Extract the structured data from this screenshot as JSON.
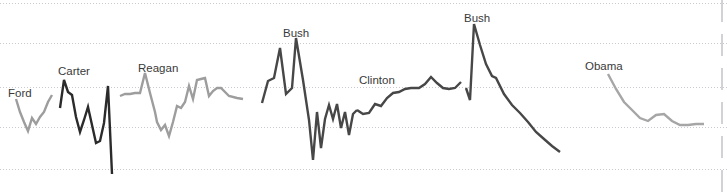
{
  "chart_data": {
    "type": "line",
    "title": "",
    "subtitle": "",
    "xlabel": "",
    "ylabel": "",
    "grid": true,
    "grid_style": "dotted-horizontal",
    "legend": "inline-annotations",
    "xlim": [
      0,
      727
    ],
    "ylim": [
      195,
      0
    ],
    "gridlines_y": [
      3,
      43,
      87,
      127,
      169
    ],
    "annotations": [
      {
        "text": "Ford",
        "x": 8,
        "y": 97
      },
      {
        "text": "Carter",
        "x": 58,
        "y": 75
      },
      {
        "text": "Reagan",
        "x": 138,
        "y": 72
      },
      {
        "text": "Bush",
        "x": 283,
        "y": 37
      },
      {
        "text": "Clinton",
        "x": 359,
        "y": 84
      },
      {
        "text": "Bush",
        "x": 464,
        "y": 22
      },
      {
        "text": "Obama",
        "x": 585,
        "y": 70
      }
    ],
    "series": [
      {
        "name": "Ford",
        "color": "#9d9d9d",
        "width": 2.4,
        "points": [
          [
            16,
            99
          ],
          [
            20,
            112
          ],
          [
            24,
            122
          ],
          [
            28,
            131
          ],
          [
            32,
            118
          ],
          [
            36,
            124
          ],
          [
            40,
            117
          ],
          [
            44,
            112
          ],
          [
            48,
            102
          ],
          [
            52,
            95
          ]
        ]
      },
      {
        "name": "Carter",
        "color": "#2b2b2b",
        "width": 2.4,
        "points": [
          [
            60,
            108
          ],
          [
            64,
            80
          ],
          [
            68,
            92
          ],
          [
            72,
            95
          ],
          [
            76,
            117
          ],
          [
            80,
            132
          ],
          [
            84,
            120
          ],
          [
            88,
            107
          ],
          [
            92,
            125
          ],
          [
            96,
            143
          ],
          [
            100,
            141
          ],
          [
            104,
            123
          ],
          [
            108,
            86
          ],
          [
            112,
            174
          ]
        ]
      },
      {
        "name": "Reagan",
        "color": "#9d9d9d",
        "width": 2.4,
        "points": [
          [
            120,
            96
          ],
          [
            125,
            94
          ],
          [
            130,
            94
          ],
          [
            135,
            93
          ],
          [
            140,
            93
          ],
          [
            145,
            73
          ],
          [
            150,
            93
          ],
          [
            155,
            112
          ],
          [
            157,
            122
          ],
          [
            161,
            130
          ],
          [
            165,
            125
          ],
          [
            169,
            136
          ],
          [
            173,
            122
          ],
          [
            177,
            106
          ],
          [
            181,
            108
          ],
          [
            185,
            102
          ],
          [
            189,
            86
          ],
          [
            193,
            99
          ],
          [
            197,
            80
          ],
          [
            201,
            79
          ],
          [
            205,
            78
          ],
          [
            209,
            96
          ],
          [
            213,
            91
          ],
          [
            217,
            88
          ],
          [
            221,
            88
          ],
          [
            229,
            96
          ],
          [
            237,
            98
          ],
          [
            243,
            99
          ]
        ]
      },
      {
        "name": "Bush",
        "color": "#474747",
        "width": 2.4,
        "points": [
          [
            262,
            103
          ],
          [
            268,
            81
          ],
          [
            274,
            78
          ],
          [
            280,
            48
          ],
          [
            286,
            94
          ],
          [
            292,
            88
          ],
          [
            296,
            38
          ],
          [
            303,
            80
          ],
          [
            309,
            120
          ],
          [
            313,
            160
          ],
          [
            317,
            112
          ],
          [
            321,
            148
          ],
          [
            325,
            119
          ],
          [
            329,
            105
          ],
          [
            333,
            119
          ],
          [
            337,
            104
          ],
          [
            341,
            128
          ],
          [
            345,
            112
          ],
          [
            349,
            135
          ],
          [
            353,
            114
          ],
          [
            357,
            110
          ]
        ]
      },
      {
        "name": "Clinton",
        "color": "#474747",
        "width": 2.4,
        "points": [
          [
            357,
            110
          ],
          [
            363,
            114
          ],
          [
            369,
            113
          ],
          [
            375,
            104
          ],
          [
            381,
            106
          ],
          [
            387,
            98
          ],
          [
            393,
            93
          ],
          [
            399,
            92
          ],
          [
            405,
            89
          ],
          [
            411,
            88
          ],
          [
            419,
            88
          ],
          [
            425,
            84
          ],
          [
            431,
            77
          ],
          [
            437,
            83
          ],
          [
            443,
            88
          ],
          [
            449,
            89
          ],
          [
            455,
            88
          ],
          [
            461,
            82
          ]
        ]
      },
      {
        "name": "Bush",
        "color": "#474747",
        "width": 2.4,
        "points": [
          [
            466,
            88
          ],
          [
            470,
            100
          ],
          [
            474,
            24
          ],
          [
            480,
            45
          ],
          [
            486,
            64
          ],
          [
            492,
            76
          ],
          [
            496,
            78
          ],
          [
            504,
            94
          ],
          [
            512,
            105
          ],
          [
            520,
            113
          ],
          [
            528,
            122
          ],
          [
            536,
            132
          ],
          [
            544,
            139
          ],
          [
            552,
            146
          ],
          [
            560,
            152
          ]
        ]
      },
      {
        "name": "Obama",
        "color": "#a6a6a6",
        "width": 2.4,
        "points": [
          [
            608,
            74
          ],
          [
            616,
            89
          ],
          [
            624,
            102
          ],
          [
            632,
            110
          ],
          [
            640,
            118
          ],
          [
            648,
            121
          ],
          [
            656,
            115
          ],
          [
            664,
            114
          ],
          [
            672,
            121
          ],
          [
            680,
            125
          ],
          [
            688,
            125
          ],
          [
            696,
            124
          ],
          [
            704,
            124
          ]
        ]
      }
    ]
  }
}
